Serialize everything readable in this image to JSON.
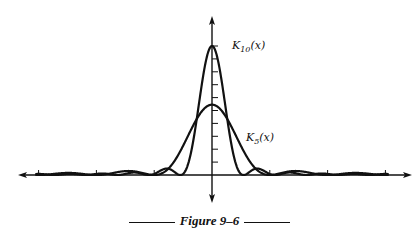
{
  "chart_data": {
    "type": "line",
    "title": "",
    "caption": "Figure 9–6",
    "xlabel": "x",
    "ylabel": "",
    "xlim": [
      -3.3,
      3.3
    ],
    "ylim": [
      0,
      11
    ],
    "x_ticks": [
      -3.1416,
      -2.0944,
      -1.0472,
      1.0472,
      2.0944,
      3.1416
    ],
    "x_tick_labels": [
      "",
      "",
      "",
      "",
      "",
      ""
    ],
    "y_ticks": [
      1,
      2,
      3,
      4,
      5,
      6,
      7,
      8,
      9,
      10
    ],
    "y_tick_labels": [
      "",
      "",
      "",
      "",
      "",
      "",
      "",
      "",
      "",
      ""
    ],
    "grid": false,
    "legend": "none",
    "series": [
      {
        "name": "K10(x)",
        "label_base": "K",
        "label_sub": "10",
        "label_arg": "(x)",
        "kind": "fejer",
        "n": 10,
        "peak": 11
      },
      {
        "name": "K5(x)",
        "label_base": "K",
        "label_sub": "5",
        "label_arg": "(x)",
        "kind": "fejer",
        "n": 5,
        "peak": 6
      }
    ],
    "annotations": [
      {
        "text": "K10(x)",
        "series": "K10(x)",
        "near": "peak, right"
      },
      {
        "text": "K5(x)",
        "series": "K5(x)",
        "near": "right flank"
      }
    ]
  },
  "figure": {
    "label": "Figure 9–6"
  }
}
